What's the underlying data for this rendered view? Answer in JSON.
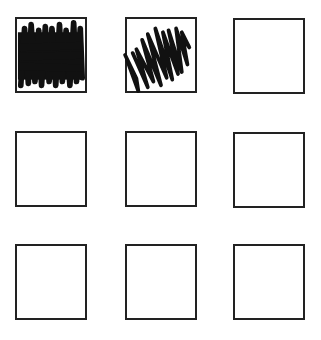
{
  "grid": {
    "rows": 3,
    "cols": 3,
    "cells": [
      {
        "row": 0,
        "col": 0,
        "state": "fully-scribbled"
      },
      {
        "row": 0,
        "col": 1,
        "state": "partially-scribbled"
      },
      {
        "row": 0,
        "col": 2,
        "state": "empty"
      },
      {
        "row": 1,
        "col": 0,
        "state": "empty"
      },
      {
        "row": 1,
        "col": 1,
        "state": "empty"
      },
      {
        "row": 1,
        "col": 2,
        "state": "empty"
      },
      {
        "row": 2,
        "col": 0,
        "state": "empty"
      },
      {
        "row": 2,
        "col": 1,
        "state": "empty"
      },
      {
        "row": 2,
        "col": 2,
        "state": "empty"
      }
    ]
  },
  "colors": {
    "ink": "#111111",
    "border": "#222222",
    "background": "#ffffff"
  }
}
